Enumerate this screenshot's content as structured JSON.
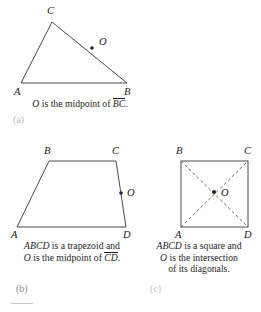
{
  "figures": {
    "triangle": {
      "vertices": [
        {
          "name": "C",
          "label": "C",
          "x": 52,
          "y": 22,
          "label_x": 47,
          "label_y": 14
        },
        {
          "name": "A",
          "label": "A",
          "x": 21,
          "y": 83,
          "label_x": 14,
          "label_y": 95
        },
        {
          "name": "B",
          "label": "B",
          "x": 127,
          "y": 83,
          "label_x": 124,
          "label_y": 95
        }
      ],
      "point_o": {
        "label": "O",
        "x": 92,
        "y": 48,
        "label_x": 99,
        "label_y": 45
      },
      "caption_line1_pre": "O",
      "caption_line1_mid": " is the midpoint of ",
      "caption_line1_seg": "BC",
      "caption_line1_end": ".",
      "sublabel": "(a)"
    },
    "trapezoid": {
      "vertices": [
        {
          "name": "B",
          "label": "B",
          "x": 49,
          "y": 161,
          "label_x": 44,
          "label_y": 154
        },
        {
          "name": "C",
          "label": "C",
          "x": 116,
          "y": 161,
          "label_x": 112,
          "label_y": 154
        },
        {
          "name": "D",
          "label": "D",
          "x": 126,
          "y": 227,
          "label_x": 123,
          "label_y": 238
        },
        {
          "name": "A",
          "label": "A",
          "x": 17,
          "y": 227,
          "label_x": 11,
          "label_y": 238
        }
      ],
      "point_o": {
        "label": "O",
        "x": 121,
        "y": 193,
        "label_x": 127,
        "label_y": 191
      },
      "caption_line1_pre": "ABCD",
      "caption_line1_post": " is a trapezoid and",
      "caption_line2_pre": "O",
      "caption_line2_mid": " is the midpoint of ",
      "caption_line2_seg": "CD",
      "caption_line2_end": ".",
      "sublabel": "(b)"
    },
    "square": {
      "vertices": [
        {
          "name": "B",
          "label": "B",
          "x": 181,
          "y": 161,
          "label_x": 176,
          "label_y": 154
        },
        {
          "name": "C",
          "label": "C",
          "x": 248,
          "y": 161,
          "label_x": 244,
          "label_y": 154
        },
        {
          "name": "D",
          "label": "D",
          "x": 248,
          "y": 227,
          "label_x": 244,
          "label_y": 238
        },
        {
          "name": "A",
          "label": "A",
          "x": 181,
          "y": 227,
          "label_x": 175,
          "label_y": 238
        }
      ],
      "point_o": {
        "label": "O",
        "x": 214,
        "y": 192,
        "label_x": 221,
        "label_y": 196
      },
      "caption_line1_pre": "ABCD",
      "caption_line1_post": " is a square and",
      "caption_line2_pre": "O",
      "caption_line2_post": " is the intersection",
      "caption_line3": "of its diagonals.",
      "sublabel": "(c)"
    }
  },
  "colors": {
    "stroke": "#4a4a4a",
    "text": "#1f1f1f",
    "dash": "#6e6e6e"
  }
}
